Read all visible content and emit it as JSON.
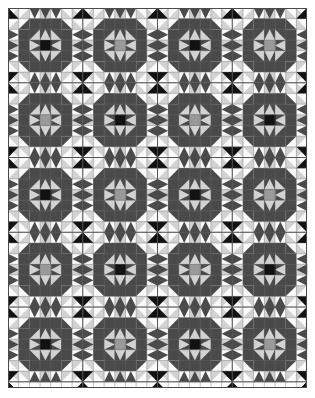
{
  "artwork": {
    "title": "Patchwork Quilt Star Block Pattern",
    "type": "geometric-quilt",
    "canvas": {
      "width": 315,
      "height": 398,
      "background": "#ffffff"
    },
    "quilt": {
      "offset_x": 8,
      "offset_y": 8,
      "width": 299,
      "height": 380,
      "blocks_across": 4,
      "blocks_down": 5,
      "cells_per_block": 7,
      "cell_size": 10.68,
      "border_color": "#4a4a4a",
      "border_width": 1
    },
    "palette": {
      "black": "#121212",
      "dark_gray": "#4a4a4a",
      "mid_gray": "#9a9a9a",
      "light_gray": "#d2d2d2",
      "white": "#fafafa",
      "seam_line": "#6a6a6a"
    },
    "palette_labels": [
      "black",
      "dark-gray",
      "mid-gray",
      "light-gray",
      "white"
    ],
    "block_centers": [
      [
        "black",
        "mid_gray",
        "black",
        "mid_gray"
      ],
      [
        "mid_gray",
        "black",
        "mid_gray",
        "black"
      ],
      [
        "black",
        "mid_gray",
        "black",
        "mid_gray"
      ],
      [
        "mid_gray",
        "black",
        "mid_gray",
        "black"
      ],
      [
        "black",
        "mid_gray",
        "black",
        "mid_gray"
      ]
    ],
    "block_accent": "dark_gray",
    "block_fill": "light_gray",
    "sash_color": "white",
    "corner_star_color": "black",
    "description": "A repeating patchwork quilt of star blocks arranged four across and five down; each block has a solid square center framed by an on-point diamond, dark triangular star points and light background triangles, separated by thin seam lines."
  }
}
